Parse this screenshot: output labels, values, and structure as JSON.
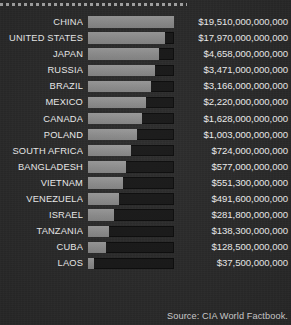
{
  "chart_data": {
    "type": "bar",
    "title": "",
    "xlabel": "",
    "ylabel": "",
    "orientation": "horizontal",
    "grid": false,
    "legend": null,
    "value_prefix": "$",
    "source": "Source: CIA World Factbook.",
    "categories": [
      "CHINA",
      "UNITED STATES",
      "JAPAN",
      "RUSSIA",
      "BRAZIL",
      "MEXICO",
      "CANADA",
      "POLAND",
      "SOUTH AFRICA",
      "BANGLADESH",
      "VIETNAM",
      "VENEZUELA",
      "ISRAEL",
      "TANZANIA",
      "CUBA",
      "LAOS"
    ],
    "values": [
      19510000000000,
      17970000000000,
      4658000000000,
      3471000000000,
      3166000000000,
      2220000000000,
      1628000000000,
      1003000000000,
      724000000000,
      577000000000,
      551300000000,
      491600000000,
      281800000000,
      138300000000,
      128500000000,
      37500000000
    ],
    "value_labels": [
      "$19,510,000,000,000",
      "$17,970,000,000,000",
      "$4,658,000,000,000",
      "$3,471,000,000,000",
      "$3,166,000,000,000",
      "$2,220,000,000,000",
      "$1,628,000,000,000",
      "$1,003,000,000,000",
      "$724,000,000,000",
      "$577,000,000,000",
      "$551,300,000,000",
      "$491,600,000,000",
      "$281,800,000,000",
      "$138,300,000,000",
      "$128,500,000,000",
      "$37,500,000,000"
    ],
    "bar_pixel_widths": [
      86,
      77,
      71,
      67,
      63,
      58,
      54,
      49,
      43,
      38,
      35,
      31,
      26,
      21,
      18,
      6
    ],
    "colors": {
      "background": "#2b2b2b",
      "bar_fill": "#8d8d8d",
      "bar_track": "#191919",
      "label_text": "#f2f2f2",
      "value_text": "#f4f4f4",
      "rule": "#a8a8a8",
      "source_text": "#d8d8d8"
    }
  }
}
